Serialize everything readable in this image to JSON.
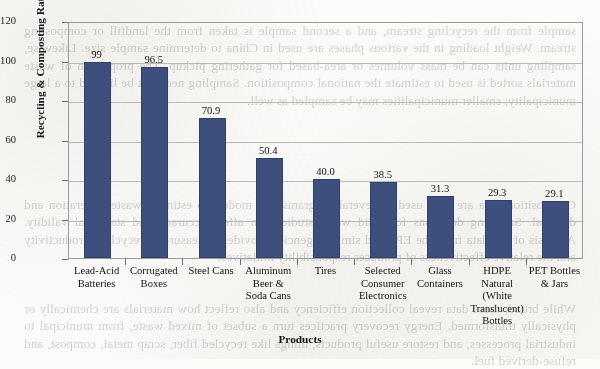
{
  "page": {
    "background_color": "#fbfbf9",
    "bleed_through_text": [
      "sample from the recycling stream, and a second sample is taken from the landfill or composting stream. Weight loading in the various phases are used in China to determine sample size. Likewise, sampling units can be mass volumes or area-based for gathering pickup. The proportion of waste materials sorted is used to estimate the national composition. Sampling need not be limited to a large municipality; smaller municipalities may be sampled as well.",
      "Composition data are then used in several programs and models to estimate waste generation and disposal. Sampling decisions for solid waste studies can affect accuracy and statistical validity. Analysis of the data from the EPA and similar agencies provides a measure of recycling productivity and the relative effectiveness of producer responsibility initiatives.",
      "While broad, these data reveal collection efficiency and also reflect how materials are chemically or physically transformed. Energy recovery practices turn a subset of mixed waste, from municipal to industrial processes, and restore useful products, things like recycled fiber, scrap metal, compost, and refuse-derived fuel."
    ]
  },
  "chart_data": {
    "type": "bar",
    "title": "",
    "xlabel": "Products",
    "ylabel": "Recycling & Composting Rate (Percent)",
    "ylim": [
      0,
      120
    ],
    "yticks": [
      0,
      20,
      40,
      60,
      80,
      100,
      120
    ],
    "grid": true,
    "legend": "none",
    "bar_color": "#3e4f7d",
    "categories": [
      "Lead-Acid\nBatteries",
      "Corrugated\nBoxes",
      "Steel Cans",
      "Aluminum\nBeer &\nSoda Cans",
      "Tires",
      "Selected\nConsumer\nElectronics",
      "Glass\nContainers",
      "HDPE\nNatural\n(White\nTranslucent)\nBottles",
      "PET Bottles\n& Jars"
    ],
    "values": [
      99,
      96.5,
      70.9,
      50.4,
      40.0,
      38.5,
      31.3,
      29.3,
      29.1
    ],
    "value_labels": [
      "99",
      "96.5",
      "70.9",
      "50.4",
      "40.0",
      "38.5",
      "31.3",
      "29.3",
      "29.1"
    ]
  }
}
